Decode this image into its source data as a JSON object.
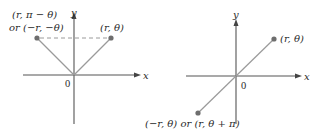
{
  "panels": [
    {
      "id": "reflection-y-axis",
      "axes": {
        "x_label": "x",
        "y_label": "y",
        "origin_label": "0"
      },
      "points": [
        {
          "label_line1": "(r, π − θ)",
          "label_line2": "or (−r, −θ)"
        },
        {
          "label": "(r, θ)"
        }
      ],
      "connector": "dashed"
    },
    {
      "id": "reflection-origin",
      "axes": {
        "x_label": "x",
        "y_label": "y",
        "origin_label": "0"
      },
      "points": [
        {
          "label": "(r, θ)"
        },
        {
          "label": "(−r, θ) or (r, θ + π)"
        }
      ],
      "connector": "line-through-origin"
    }
  ],
  "colors": {
    "axis": "#555555",
    "ray": "#9a9a9a",
    "point": "#6e6e6e",
    "text": "#2a2a2a"
  }
}
